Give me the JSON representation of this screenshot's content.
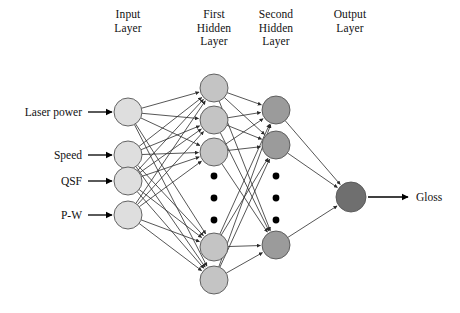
{
  "figure": {
    "type": "neural-network-architecture-diagram",
    "background_color": "#ffffff",
    "width": 460,
    "height": 313
  },
  "layer_titles": [
    {
      "id": "input-layer-title",
      "text": "Input\nLayer",
      "cx": 128,
      "top": 8
    },
    {
      "id": "first-hidden-layer-title",
      "text": "First\nHidden\nLayer",
      "cx": 214,
      "top": 8
    },
    {
      "id": "second-hidden-layer-title",
      "text": "Second\nHidden\nLayer",
      "cx": 276,
      "top": 8
    },
    {
      "id": "output-layer-title",
      "text": "Output\nLayer",
      "cx": 350,
      "top": 8
    }
  ],
  "input_labels": [
    {
      "text": "Laser power",
      "y": 112
    },
    {
      "text": "Speed",
      "y": 155
    },
    {
      "text": "QSF",
      "y": 181
    },
    {
      "text": "P-W",
      "y": 215
    }
  ],
  "output_labels": [
    {
      "text": "Gloss",
      "y": 197
    }
  ],
  "colors": {
    "input_node_fill": "#dedede",
    "first_hidden_node_fill": "#c4c4c4",
    "second_hidden_node_fill": "#9b9b9b",
    "output_node_fill": "#6f6f6f",
    "node_stroke": "#555555",
    "edge_stroke": "#2b2b2b",
    "arrow_stroke": "#000000",
    "ellipsis_dot": "#000000",
    "text": "#111111"
  },
  "geometry": {
    "node_radius": 14,
    "output_node_radius": 15,
    "input_x": 128,
    "first_hidden_x": 214,
    "second_hidden_x": 276,
    "output_x": 351,
    "input_arrow_x_start": 88,
    "input_arrow_x_end": 112,
    "output_arrow_x_start": 368,
    "output_arrow_x_end": 408
  },
  "nodes": {
    "input": [
      {
        "id": "input-node-1",
        "cx": 128,
        "cy": 112
      },
      {
        "id": "input-node-2",
        "cx": 128,
        "cy": 155
      },
      {
        "id": "input-node-3",
        "cx": 128,
        "cy": 181
      },
      {
        "id": "input-node-4",
        "cx": 128,
        "cy": 215
      }
    ],
    "first_hidden": [
      {
        "id": "first-hidden-node-1",
        "cx": 214,
        "cy": 88
      },
      {
        "id": "first-hidden-node-2",
        "cx": 214,
        "cy": 120
      },
      {
        "id": "first-hidden-node-3",
        "cx": 214,
        "cy": 152
      },
      {
        "id": "first-hidden-node-4",
        "cx": 214,
        "cy": 247
      },
      {
        "id": "first-hidden-node-5",
        "cx": 214,
        "cy": 280
      }
    ],
    "second_hidden": [
      {
        "id": "second-hidden-node-1",
        "cx": 276,
        "cy": 110
      },
      {
        "id": "second-hidden-node-2",
        "cx": 276,
        "cy": 145
      },
      {
        "id": "second-hidden-node-3",
        "cx": 276,
        "cy": 245
      }
    ],
    "output": [
      {
        "id": "output-node-1",
        "cx": 351,
        "cy": 197
      }
    ]
  },
  "ellipses": {
    "first_hidden": {
      "cx": 214,
      "dots_y": [
        176,
        198,
        220
      ],
      "r": 3.4
    },
    "second_hidden": {
      "cx": 276,
      "dots_y": [
        176,
        198,
        220
      ],
      "r": 3.4
    }
  },
  "chart_data": {
    "type": "diagram",
    "layers": [
      {
        "name": "Input Layer",
        "visible_nodes": 4,
        "labels": [
          "Laser power",
          "Speed",
          "QSF",
          "P-W"
        ]
      },
      {
        "name": "First Hidden Layer",
        "visible_nodes": 5,
        "truncated": true
      },
      {
        "name": "Second Hidden Layer",
        "visible_nodes": 3,
        "truncated": true
      },
      {
        "name": "Output Layer",
        "visible_nodes": 1,
        "labels": [
          "Gloss"
        ]
      }
    ],
    "connectivity": "fully-connected feed-forward, left to right",
    "inputs": [
      "Laser power",
      "Speed",
      "QSF",
      "P-W"
    ],
    "outputs": [
      "Gloss"
    ]
  }
}
